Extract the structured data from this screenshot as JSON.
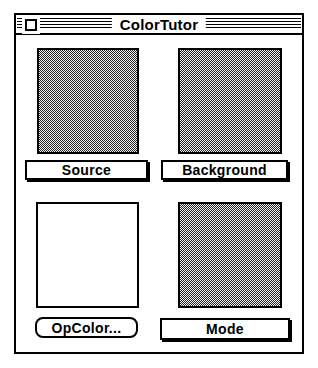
{
  "window": {
    "title": "ColorTutor"
  },
  "panels": {
    "source": {
      "label": "Source",
      "swatch": "50-percent-gray-dither"
    },
    "background": {
      "label": "Background",
      "swatch": "50-percent-gray-dither"
    },
    "opcolor": {
      "label": "OpColor...",
      "swatch": "white"
    },
    "mode": {
      "label": "Mode",
      "swatch": "50-percent-gray-dither"
    }
  },
  "colors": {
    "window_border": "#000000",
    "window_background": "#ffffff",
    "dither_dark": "#222222",
    "dither_light": "#f2f2f2",
    "button_background": "#ffffff"
  }
}
